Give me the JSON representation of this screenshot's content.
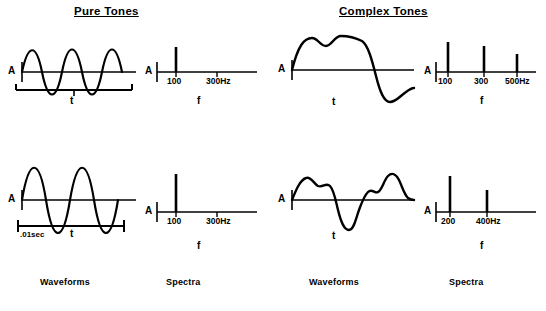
{
  "headers": {
    "left": "Pure Tones",
    "right": "Complex Tones"
  },
  "footers": {
    "waveforms_top_left": "Waveforms",
    "spectra_top_left": "Spectra",
    "waveforms_right": "Waveforms",
    "spectra_right": "Spectra"
  },
  "panels": {
    "pure_wave_1": {
      "y_axis_label": "A",
      "x_axis_label": "t",
      "duration_label": ""
    },
    "pure_spec_1": {
      "y_axis_label": "A",
      "x_axis_label": "f",
      "ticks": [
        "100",
        "300Hz"
      ]
    },
    "pure_wave_2": {
      "y_axis_label": "A",
      "x_axis_label": "t",
      "duration_label": ".01sec"
    },
    "pure_spec_2": {
      "y_axis_label": "A",
      "x_axis_label": "f",
      "ticks": [
        "100",
        "300Hz"
      ]
    },
    "complex_wave_1": {
      "y_axis_label": "A",
      "x_axis_label": "t"
    },
    "complex_spec_1": {
      "y_axis_label": "A",
      "x_axis_label": "f",
      "ticks": [
        "100",
        "300",
        "500Hz"
      ]
    },
    "complex_wave_2": {
      "y_axis_label": "A",
      "x_axis_label": "t"
    },
    "complex_spec_2": {
      "y_axis_label": "A",
      "x_axis_label": "f",
      "ticks": [
        "200",
        "400Hz"
      ]
    }
  },
  "colors": {
    "ink": "#000000",
    "background": "#ffffff"
  }
}
